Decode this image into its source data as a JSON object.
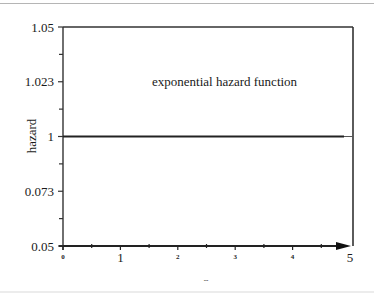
{
  "chart_data": {
    "type": "line",
    "title": "",
    "annotation": "exponential hazard function",
    "xlabel": "",
    "ylabel": "hazard",
    "xlim": [
      0,
      5
    ],
    "ylim": [
      0.05,
      1.05
    ],
    "x_ticks": [
      0,
      1,
      2,
      3,
      4,
      5
    ],
    "x_tick_labels": [
      "0",
      "1",
      "2",
      "3",
      "4",
      "5"
    ],
    "x_minor_ticks": [
      0.5,
      1.5,
      2.5,
      3.5,
      4.5
    ],
    "y_ticks": [
      0.05,
      0.073,
      1,
      1.023,
      1.05
    ],
    "y_tick_labels": [
      "0.05",
      "0.073",
      "1",
      "1.023",
      "1.05"
    ],
    "y_minor_count_between": 1,
    "grid": false,
    "series": [
      {
        "name": "exponential hazard",
        "x": [
          0,
          5
        ],
        "y": [
          1,
          1
        ],
        "color": "#222222"
      }
    ]
  }
}
